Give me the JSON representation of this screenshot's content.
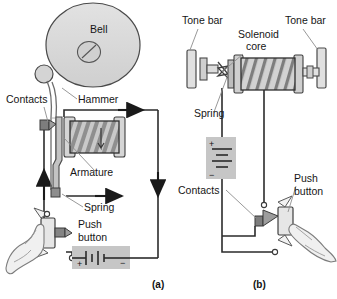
{
  "figure": {
    "background": "#ffffff",
    "ink": "#1a1a1a",
    "fill_light": "#d8d8d8",
    "fill_mid": "#b9b9b9",
    "fill_dark": "#8a8a8a",
    "leader_color": "#8d8d8d"
  },
  "panels": [
    {
      "id": "a",
      "caption": "(a)",
      "caption_pos": {
        "x": 152,
        "y": 288
      },
      "labels": [
        {
          "key": "bell",
          "text": "Bell",
          "x": 90,
          "y": 33,
          "anchor": "start"
        },
        {
          "key": "hammer",
          "text": "Hammer",
          "x": 78,
          "y": 103,
          "anchor": "start"
        },
        {
          "key": "contacts",
          "text": "Contacts",
          "x": 6,
          "y": 103,
          "anchor": "start"
        },
        {
          "key": "armature",
          "text": "Armature",
          "x": 70,
          "y": 176,
          "anchor": "start"
        },
        {
          "key": "spring",
          "text": "Spring",
          "x": 84,
          "y": 211,
          "anchor": "start"
        },
        {
          "key": "push",
          "text": "Push",
          "x": 78,
          "y": 228,
          "anchor": "start"
        },
        {
          "key": "button",
          "text": "button",
          "x": 78,
          "y": 241,
          "anchor": "start"
        }
      ],
      "battery": {
        "plus": "+",
        "minus": "−"
      }
    },
    {
      "id": "b",
      "caption": "(b)",
      "caption_pos": {
        "x": 253,
        "y": 288
      },
      "labels": [
        {
          "key": "tone-bar-left",
          "text": "Tone bar",
          "x": 182,
          "y": 24,
          "anchor": "start"
        },
        {
          "key": "tone-bar-right",
          "text": "Tone bar",
          "x": 285,
          "y": 24,
          "anchor": "start"
        },
        {
          "key": "solenoid",
          "text": "Solenoid",
          "x": 238,
          "y": 38,
          "anchor": "start"
        },
        {
          "key": "core",
          "text": "core",
          "x": 246,
          "y": 50,
          "anchor": "start"
        },
        {
          "key": "spring",
          "text": "Spring",
          "x": 194,
          "y": 117,
          "anchor": "start"
        },
        {
          "key": "contacts",
          "text": "Contacts",
          "x": 178,
          "y": 194,
          "anchor": "start"
        },
        {
          "key": "push",
          "text": "Push",
          "x": 294,
          "y": 182,
          "anchor": "start"
        },
        {
          "key": "button",
          "text": "button",
          "x": 294,
          "y": 195,
          "anchor": "start"
        }
      ],
      "battery": {
        "plus": "+",
        "minus": "−"
      }
    }
  ],
  "icons": [
    "bell-disc-icon",
    "hammer-icon",
    "armature-icon",
    "solenoid-coil-icon",
    "spring-icon",
    "contacts-icon",
    "push-button-icon",
    "hand-icon",
    "battery-icon",
    "tone-bar-icon",
    "current-arrow-icon"
  ]
}
